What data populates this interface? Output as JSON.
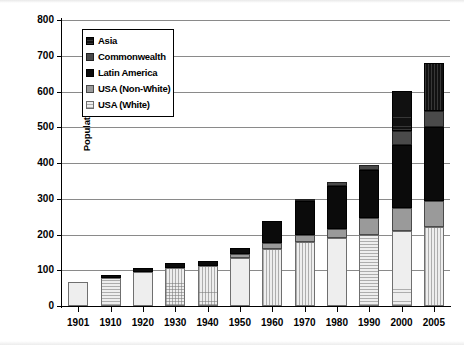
{
  "chart_data": {
    "type": "bar",
    "subtype": "stacked-bar",
    "title": "",
    "xlabel": "",
    "ylabel": "Population in millions",
    "ylim": [
      0,
      800
    ],
    "ytick_step": 100,
    "yticks": [
      "0",
      "100",
      "200",
      "300",
      "400",
      "500",
      "600",
      "700",
      "800"
    ],
    "grid": true,
    "grid_axis": "y",
    "legend_position": "upper-left-inside",
    "categories": [
      "1901",
      "1910",
      "1920",
      "1930",
      "1940",
      "1950",
      "1960",
      "1970",
      "1980",
      "1990",
      "2000",
      "2005"
    ],
    "series": [
      {
        "name": "USA (White)",
        "color": "#eeeeee",
        "pattern": "fine-grid",
        "values": [
          67,
          78,
          96,
          107,
          113,
          135,
          160,
          180,
          190,
          200,
          210,
          220
        ]
      },
      {
        "name": "USA (Non-White)",
        "color": "#9a9a9a",
        "pattern": "solid",
        "values": [
          0,
          0,
          0,
          0,
          0,
          10,
          15,
          18,
          25,
          45,
          65,
          75
        ]
      },
      {
        "name": "Latin America",
        "color": "#0b0b0b",
        "pattern": "solid",
        "values": [
          0,
          8,
          10,
          12,
          14,
          18,
          63,
          95,
          120,
          135,
          175,
          205
        ]
      },
      {
        "name": "Commonwealth",
        "color": "#4a4a4a",
        "pattern": "solid",
        "values": [
          0,
          0,
          0,
          0,
          0,
          0,
          0,
          5,
          12,
          15,
          40,
          45
        ]
      },
      {
        "name": "Asia",
        "color": "#111111",
        "pattern": "fine-grid-dark",
        "values": [
          0,
          0,
          0,
          0,
          0,
          0,
          0,
          0,
          0,
          0,
          112,
          135
        ]
      }
    ],
    "totals": [
      67,
      86,
      106,
      119,
      127,
      163,
      238,
      298,
      347,
      395,
      602,
      680
    ],
    "legend_order": [
      "Asia",
      "Commonwealth",
      "Latin America",
      "USA (Non-White)",
      "USA (White)"
    ]
  },
  "legend": {
    "items": [
      {
        "label": "Asia",
        "swatch": "sw-asia"
      },
      {
        "label": "Commonwealth",
        "swatch": "sw-commonwealth"
      },
      {
        "label": "Latin America",
        "swatch": "sw-latin"
      },
      {
        "label": "USA (Non-White)",
        "swatch": "sw-usa-nonwhite"
      },
      {
        "label": "USA (White)",
        "swatch": "sw-usa-white"
      }
    ]
  }
}
